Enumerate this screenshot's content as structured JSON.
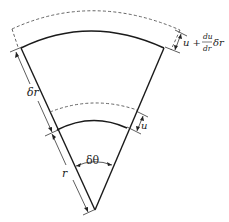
{
  "diagram": {
    "labels": {
      "delta_r": "δr",
      "r": "r",
      "delta_theta": "δθ",
      "u": "u",
      "u_plus": "u +",
      "du": "du",
      "dr": "dr",
      "delta_r_suffix": "δr"
    },
    "colors": {
      "line": "#1a1a1a",
      "dashed": "#555555",
      "background": "#ffffff"
    }
  }
}
